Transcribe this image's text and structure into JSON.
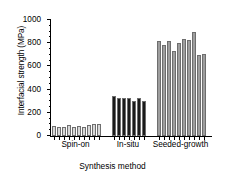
{
  "chart_data": {
    "type": "bar",
    "title": "",
    "xlabel": "Synthesis method",
    "ylabel": "Interfacial strength (MPa)",
    "ylim": [
      0,
      1000
    ],
    "yticks": [
      0,
      200,
      400,
      600,
      800,
      1000
    ],
    "ytick_labels": [
      "0",
      "200",
      "400",
      "600",
      "800",
      "1000"
    ],
    "minor_tick_step": 50,
    "grid": false,
    "legend": "none",
    "categories": [
      "Spin-on",
      "In-situ",
      "Seeded-growth"
    ],
    "group_colors": {
      "Spin-on": "#d8d8d8",
      "In-situ": "#1a1a1a",
      "Seeded-growth": "#9e9e9e"
    },
    "bar_edge_color": "#6e6e6e",
    "axis_color": "#000000",
    "groups": [
      {
        "name": "Spin-on",
        "color": "#d8d8d8",
        "values": [
          90,
          78,
          82,
          92,
          80,
          90,
          82,
          96,
          100,
          105
        ]
      },
      {
        "name": "In-situ",
        "color": "#1a1a1a",
        "values": [
          342,
          330,
          332,
          330,
          305,
          325,
          298
        ]
      },
      {
        "name": "Seeded-growth",
        "color": "#9e9e9e",
        "values": [
          822,
          785,
          818,
          735,
          800,
          840,
          828,
          900,
          702,
          705
        ]
      }
    ]
  }
}
